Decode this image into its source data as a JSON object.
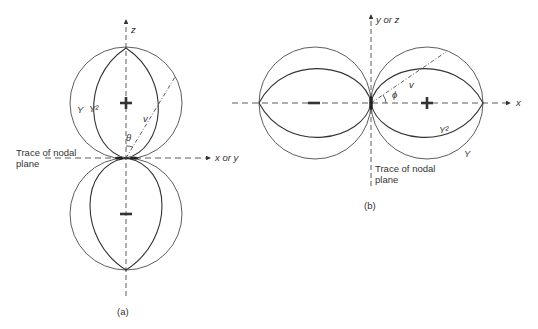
{
  "figure_a": {
    "caption": "(a)",
    "axis_vertical_label": "z",
    "axis_horizontal_label": "x  or y",
    "nodal_plane_label_line1": "Trace of nodal",
    "nodal_plane_label_line2": "plane",
    "curve_outer_label": "Y",
    "curve_inner_label": "Y²",
    "radius_label": "v",
    "angle_label": "θ",
    "upper_lobe_sign": "+",
    "lower_lobe_sign": "−"
  },
  "figure_b": {
    "caption": "(b)",
    "axis_vertical_label": "y  or z",
    "axis_horizontal_label": "x",
    "nodal_plane_label_line1": "Trace of nodal",
    "nodal_plane_label_line2": "plane",
    "curve_outer_label": "Y",
    "curve_inner_label": "Y²",
    "radius_label": "v",
    "angle_label": "ϕ",
    "right_lobe_sign": "+",
    "left_lobe_sign": "−"
  },
  "colors": {
    "line": "#333333",
    "background": "#ffffff"
  }
}
